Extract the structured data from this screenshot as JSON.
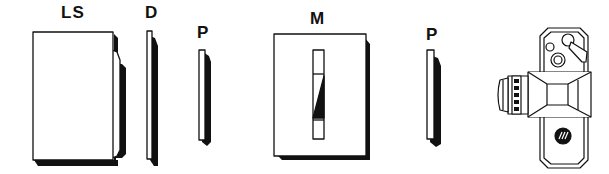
{
  "diagram": {
    "components": [
      {
        "id": "ls",
        "label": "LS",
        "description": "light source box"
      },
      {
        "id": "d",
        "label": "D",
        "description": "diffuser plate"
      },
      {
        "id": "p1",
        "label": "P",
        "description": "polarizer"
      },
      {
        "id": "m",
        "label": "M",
        "description": "model holder with slot specimen"
      },
      {
        "id": "p2",
        "label": "P",
        "description": "polarizer (analyzer)"
      },
      {
        "id": "camera",
        "label": "",
        "description": "camera, top view"
      }
    ]
  },
  "colors": {
    "ink": "#111111",
    "paper": "#ffffff"
  }
}
